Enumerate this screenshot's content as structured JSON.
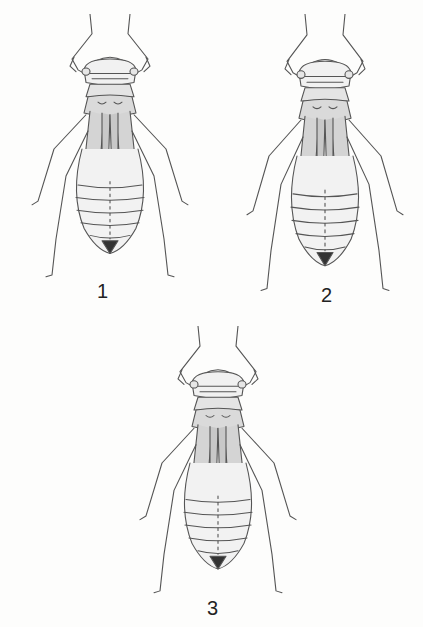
{
  "plate": {
    "description": "Scientific pen illustrations of three insect nymphs (exuviae), dorsal view",
    "figures": [
      {
        "label": "1"
      },
      {
        "label": "2"
      },
      {
        "label": "3"
      }
    ]
  }
}
